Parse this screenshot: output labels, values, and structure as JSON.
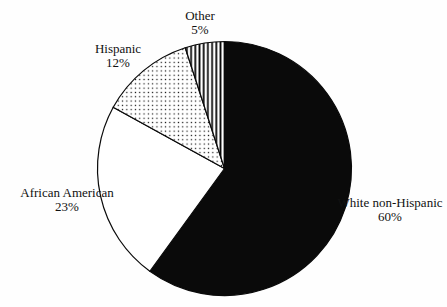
{
  "chart_data": {
    "type": "pie",
    "direction": "clockwise",
    "start_angle_deg": 0,
    "legend_position": "none",
    "labels_style": "two-line callout labels around pie, name above percent",
    "slices": [
      {
        "label": "White non-Hispanic",
        "value": 60,
        "pct_label": "60%",
        "fill": "solid-black"
      },
      {
        "label": "African American",
        "value": 23,
        "pct_label": "23%",
        "fill": "white"
      },
      {
        "label": "Hispanic",
        "value": 12,
        "pct_label": "12%",
        "fill": "dots"
      },
      {
        "label": "Other",
        "value": 5,
        "pct_label": "5%",
        "fill": "vertical-stripes"
      }
    ],
    "colors": {
      "ink": "#0a0a0a",
      "background": "#ffffff"
    }
  }
}
